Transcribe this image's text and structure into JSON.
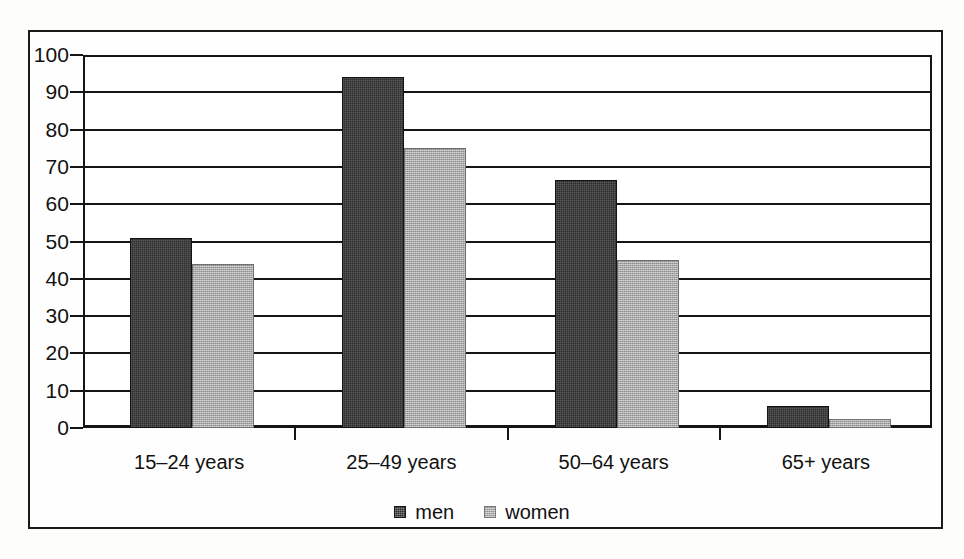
{
  "chart_data": {
    "type": "bar",
    "title": "",
    "subtitle": "",
    "xlabel": "",
    "ylabel": "",
    "categories": [
      "15–24 years",
      "25–49 years",
      "50–64 years",
      "65+ years"
    ],
    "series": [
      {
        "name": "men",
        "color": "#2e2e2e",
        "values": [
          51,
          94,
          66.5,
          6
        ]
      },
      {
        "name": "women",
        "color": "#a9a9a9",
        "values": [
          44,
          75,
          45,
          2.5
        ]
      }
    ],
    "ylim": [
      0,
      100
    ],
    "ytick_labels": [
      "100",
      "90",
      "80",
      "70",
      "60",
      "50",
      "40",
      "30",
      "20",
      "10",
      "0"
    ],
    "ytick_values": [
      100,
      90,
      80,
      70,
      60,
      50,
      40,
      30,
      20,
      10,
      0
    ],
    "ytick_step": 10,
    "grid": "horizontal",
    "legend_position": "bottom-center",
    "legend": [
      {
        "label": "men",
        "swatch": "men"
      },
      {
        "label": "women",
        "swatch": "women"
      }
    ]
  },
  "figure": {
    "border_color": "#1a1a1a",
    "background": "#ffffff"
  }
}
